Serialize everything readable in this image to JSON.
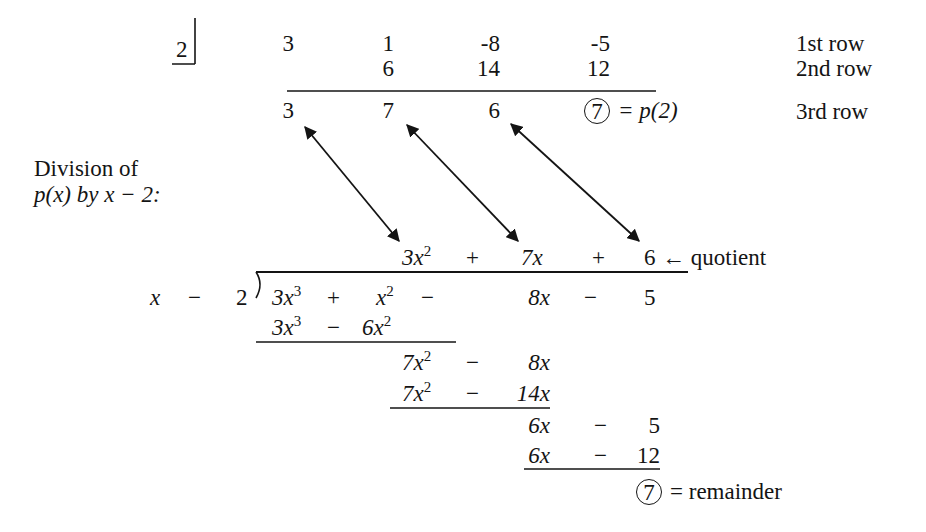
{
  "synthetic": {
    "divisor": "2",
    "row1": [
      "3",
      "1",
      "-8",
      "-5"
    ],
    "row2": [
      "6",
      "14",
      "12"
    ],
    "row3": [
      "3",
      "7",
      "6"
    ],
    "remainder": "7",
    "remainder_eq": "= p(2)",
    "row_labels": [
      "1st row",
      "2nd row",
      "3rd row"
    ]
  },
  "caption": {
    "line1": "Division of",
    "line2": "p(x) by x − 2:"
  },
  "long_division": {
    "quotient": {
      "t1": "3x",
      "t1_exp": "2",
      "op1": "+",
      "t2": "7x",
      "op2": "+",
      "t3": "6"
    },
    "quotient_label": "← quotient",
    "divisor": {
      "x": "x",
      "op": "−",
      "c": "2"
    },
    "dividend": {
      "t1": "3x",
      "t1_exp": "3",
      "op1": "+",
      "t2": "x",
      "t2_exp": "2",
      "op2": "−",
      "t3": "8x",
      "op3": "−",
      "t4": "5"
    },
    "steps": [
      {
        "a": "3x",
        "a_exp": "3",
        "op": "−",
        "b": "6x",
        "b_exp": "2"
      },
      {
        "a": "7x",
        "a_exp": "2",
        "op": "−",
        "b": "8x"
      },
      {
        "a": "7x",
        "a_exp": "2",
        "op": "−",
        "b": "14x"
      },
      {
        "a": "6x",
        "op": "−",
        "b": "5"
      },
      {
        "a": "6x",
        "op": "−",
        "b": "12"
      }
    ],
    "remainder": "7",
    "remainder_label": "= remainder"
  }
}
